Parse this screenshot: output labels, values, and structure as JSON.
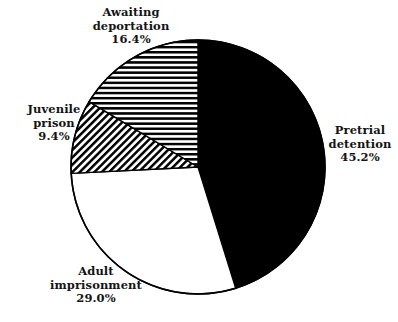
{
  "chart_data": {
    "type": "pie",
    "title": "",
    "subtitle": "",
    "xlabel": "",
    "ylabel": "",
    "legend_position": "none",
    "grid": false,
    "labels_outside": true,
    "total_percent": "100.0%",
    "categories": [
      "Pretrial detention",
      "Adult imprisonment",
      "Juvenile prison",
      "Awaiting deportation"
    ],
    "values": [
      45.2,
      29.0,
      9.4,
      16.4
    ],
    "value_labels": [
      "45.2%",
      "29.0%",
      "9.4%",
      "16.4%"
    ],
    "start_angle_deg": 0,
    "direction": "clockwise",
    "slices": [
      {
        "name": "Pretrial detention",
        "label_line1": "Pretrial",
        "label_line2": "detention",
        "value": 45.2,
        "value_label": "45.2%",
        "fill": "solid-black",
        "color": "#000000",
        "start_deg": 0.0,
        "end_deg": 162.72
      },
      {
        "name": "Adult imprisonment",
        "label_line1": "Adult",
        "label_line2": "imprisonment",
        "value": 29.0,
        "value_label": "29.0%",
        "fill": "solid-white",
        "color": "#ffffff",
        "start_deg": 162.72,
        "end_deg": 267.12
      },
      {
        "name": "Juvenile prison",
        "label_line1": "Juvenile",
        "label_line2": "prison",
        "value": 9.4,
        "value_label": "9.4%",
        "fill": "diagonal-hatch",
        "color": "#000000",
        "start_deg": 267.12,
        "end_deg": 300.96
      },
      {
        "name": "Awaiting deportation",
        "label_line1": "Awaiting",
        "label_line2": "deportation",
        "value": 16.4,
        "value_label": "16.4%",
        "fill": "horizontal-stripes",
        "color": "#000000",
        "start_deg": 300.96,
        "end_deg": 360.0
      }
    ],
    "geometry": {
      "center_x": 198,
      "center_y": 167,
      "radius": 127
    },
    "colors": {
      "outline": "#000000",
      "background": "#ffffff",
      "text": "#141414"
    }
  }
}
